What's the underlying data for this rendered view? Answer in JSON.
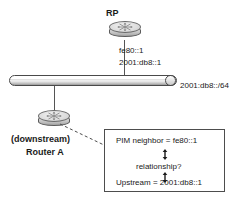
{
  "diagram": {
    "title_node": "RP",
    "rp_interface_labels": [
      "fe80::1",
      "2001:db8::1"
    ],
    "segment_label": "2001:db8::/64",
    "downstream_label_line1": "(downstream)",
    "downstream_label_line2": "Router A",
    "callout": {
      "line1": "PIM neighbor = fe80::1",
      "line2": "relationship?",
      "line3": "Upstream = 2001:db8::1"
    },
    "icons": {
      "rp_router": "router-icon",
      "downstream_router": "router-icon",
      "ethernet_segment": "ethernet-bus-icon",
      "up_down_arrow": "double-headed-arrow-icon"
    },
    "colors": {
      "line": "#555555",
      "text": "#1a1a1a",
      "box_border": "#4d4d4d",
      "background": "#ffffff"
    }
  }
}
